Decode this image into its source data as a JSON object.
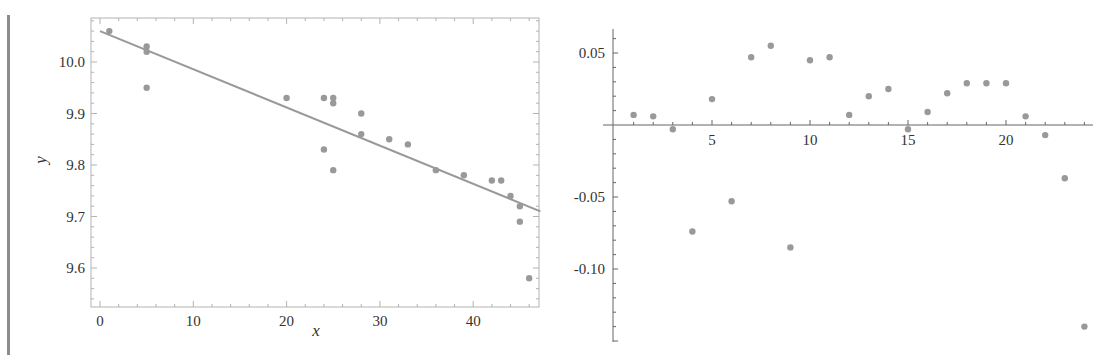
{
  "chart_data": [
    {
      "type": "scatter",
      "title": "",
      "xlabel": "x",
      "ylabel": "y",
      "xlim": [
        -1,
        47.2
      ],
      "ylim": [
        9.53,
        10.085
      ],
      "xticks": [
        0,
        10,
        20,
        30,
        40
      ],
      "yticks": [
        9.6,
        9.7,
        9.8,
        9.9,
        10.0
      ],
      "xtick_labels": [
        "0",
        "10",
        "20",
        "30",
        "40"
      ],
      "ytick_labels": [
        "9.6",
        "9.7",
        "9.8",
        "9.9",
        "10.0"
      ],
      "frame": true,
      "grid": false,
      "point_color": "#999999",
      "line_color": "#999999",
      "points": [
        {
          "x": 1,
          "y": 10.06
        },
        {
          "x": 5,
          "y": 10.03
        },
        {
          "x": 5,
          "y": 10.02
        },
        {
          "x": 5,
          "y": 9.95
        },
        {
          "x": 20,
          "y": 9.93
        },
        {
          "x": 24,
          "y": 9.93
        },
        {
          "x": 25,
          "y": 9.93
        },
        {
          "x": 25,
          "y": 9.92
        },
        {
          "x": 24,
          "y": 9.83
        },
        {
          "x": 25,
          "y": 9.79
        },
        {
          "x": 28,
          "y": 9.9
        },
        {
          "x": 28,
          "y": 9.86
        },
        {
          "x": 31,
          "y": 9.85
        },
        {
          "x": 33,
          "y": 9.84
        },
        {
          "x": 36,
          "y": 9.79
        },
        {
          "x": 39,
          "y": 9.78
        },
        {
          "x": 42,
          "y": 9.77
        },
        {
          "x": 43,
          "y": 9.77
        },
        {
          "x": 44,
          "y": 9.74
        },
        {
          "x": 45,
          "y": 9.72
        },
        {
          "x": 45,
          "y": 9.69
        },
        {
          "x": 46,
          "y": 9.58
        }
      ],
      "fit_line": {
        "x0": 0,
        "y0": 10.06,
        "x1": 47.2,
        "y1": 9.71
      }
    },
    {
      "type": "scatter",
      "title": "",
      "xlabel": "",
      "ylabel": "",
      "xlim": [
        -0.5,
        24.5
      ],
      "ylim": [
        -0.151,
        0.061
      ],
      "xticks": [
        5,
        10,
        15,
        20
      ],
      "yticks": [
        0.05,
        -0.05,
        -0.1
      ],
      "xtick_labels": [
        "5",
        "10",
        "15",
        "20"
      ],
      "ytick_labels": [
        "0.05",
        "-0.05",
        "-0.10"
      ],
      "frame": false,
      "grid": false,
      "point_color": "#999999",
      "points": [
        {
          "x": 1,
          "y": 0.007
        },
        {
          "x": 2,
          "y": 0.006
        },
        {
          "x": 3,
          "y": -0.003
        },
        {
          "x": 4,
          "y": -0.074
        },
        {
          "x": 5,
          "y": 0.018
        },
        {
          "x": 6,
          "y": -0.053
        },
        {
          "x": 7,
          "y": 0.047
        },
        {
          "x": 8,
          "y": 0.055
        },
        {
          "x": 9,
          "y": -0.085
        },
        {
          "x": 10,
          "y": 0.045
        },
        {
          "x": 11,
          "y": 0.047
        },
        {
          "x": 12,
          "y": 0.007
        },
        {
          "x": 13,
          "y": 0.02
        },
        {
          "x": 14,
          "y": 0.025
        },
        {
          "x": 15,
          "y": -0.003
        },
        {
          "x": 16,
          "y": 0.009
        },
        {
          "x": 17,
          "y": 0.022
        },
        {
          "x": 18,
          "y": 0.029
        },
        {
          "x": 19,
          "y": 0.029
        },
        {
          "x": 20,
          "y": 0.029
        },
        {
          "x": 21,
          "y": 0.006
        },
        {
          "x": 22,
          "y": -0.007
        },
        {
          "x": 23,
          "y": -0.037
        },
        {
          "x": 24,
          "y": -0.14
        }
      ]
    }
  ]
}
